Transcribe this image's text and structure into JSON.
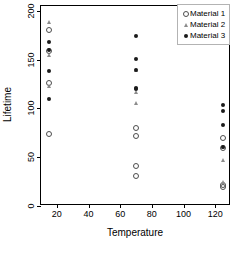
{
  "chart_data": {
    "type": "scatter",
    "title": "",
    "xlabel": "Temperature",
    "ylabel": "Lifetime",
    "xlim": [
      10,
      130
    ],
    "ylim": [
      0,
      205
    ],
    "xticks": [
      20,
      40,
      60,
      80,
      100,
      120
    ],
    "yticks": [
      0,
      50,
      100,
      150,
      200
    ],
    "grid": false,
    "legend_position": "top-right",
    "series": [
      {
        "name": "Material 1",
        "marker": "open-circle",
        "color": "#4d4d4d",
        "points": [
          {
            "x": 15,
            "y": 180
          },
          {
            "x": 15,
            "y": 159
          },
          {
            "x": 15,
            "y": 126
          },
          {
            "x": 15,
            "y": 74
          },
          {
            "x": 70,
            "y": 80
          },
          {
            "x": 70,
            "y": 72
          },
          {
            "x": 70,
            "y": 41
          },
          {
            "x": 70,
            "y": 31
          },
          {
            "x": 125,
            "y": 70
          },
          {
            "x": 125,
            "y": 59
          },
          {
            "x": 125,
            "y": 22
          },
          {
            "x": 125,
            "y": 19
          }
        ]
      },
      {
        "name": "Material 2",
        "marker": "triangle",
        "color": "#8c8c8c",
        "points": [
          {
            "x": 15,
            "y": 189
          },
          {
            "x": 15,
            "y": 155
          },
          {
            "x": 15,
            "y": 123
          },
          {
            "x": 70,
            "y": 139
          },
          {
            "x": 70,
            "y": 117
          },
          {
            "x": 70,
            "y": 106
          },
          {
            "x": 125,
            "y": 60
          },
          {
            "x": 125,
            "y": 47
          },
          {
            "x": 125,
            "y": 25
          }
        ]
      },
      {
        "name": "Material 3",
        "marker": "filled-circle",
        "color": "#1a1a1a",
        "points": [
          {
            "x": 15,
            "y": 168
          },
          {
            "x": 15,
            "y": 160
          },
          {
            "x": 15,
            "y": 138
          },
          {
            "x": 15,
            "y": 110
          },
          {
            "x": 70,
            "y": 174
          },
          {
            "x": 70,
            "y": 151
          },
          {
            "x": 70,
            "y": 139
          },
          {
            "x": 70,
            "y": 121
          },
          {
            "x": 70,
            "y": 120
          },
          {
            "x": 125,
            "y": 104
          },
          {
            "x": 125,
            "y": 97
          },
          {
            "x": 125,
            "y": 83
          },
          {
            "x": 125,
            "y": 60
          }
        ]
      }
    ]
  },
  "legend": {
    "items": [
      {
        "label": "Material 1"
      },
      {
        "label": "Material 2"
      },
      {
        "label": "Material 3"
      }
    ]
  }
}
